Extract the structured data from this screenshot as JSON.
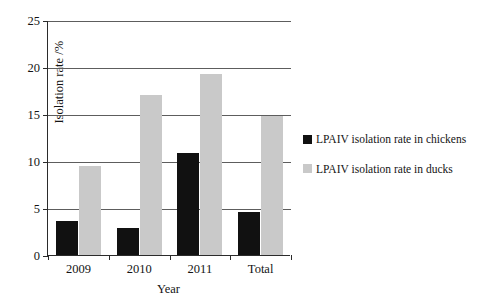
{
  "chart_data": {
    "type": "bar",
    "title": "",
    "xlabel": "Year",
    "ylabel": "Isolation rate /%",
    "categories": [
      "2009",
      "2010",
      "2011",
      "Total"
    ],
    "series": [
      {
        "name": "LPAIV isolation rate in chickens",
        "color": "#111111",
        "values": [
          3.6,
          2.9,
          10.9,
          4.6
        ]
      },
      {
        "name": "LPAIV isolation rate in ducks",
        "color": "#c9c9c9",
        "values": [
          9.5,
          17.0,
          19.3,
          14.8
        ]
      }
    ],
    "ylim": [
      0,
      25
    ],
    "yticks": [
      0,
      5,
      10,
      15,
      20,
      25
    ],
    "ytick_labels": [
      "0",
      "5",
      "10",
      "15",
      "20",
      "25"
    ],
    "grid": "horizontal",
    "legend_position": "right"
  },
  "axes": {
    "y_title": "Isolation rate /%",
    "x_title": "Year"
  },
  "legend": {
    "items": [
      {
        "label": "LPAIV isolation rate in chickens",
        "swatch": "chickens"
      },
      {
        "label": "LPAIV isolation rate in ducks",
        "swatch": "ducks"
      }
    ]
  }
}
